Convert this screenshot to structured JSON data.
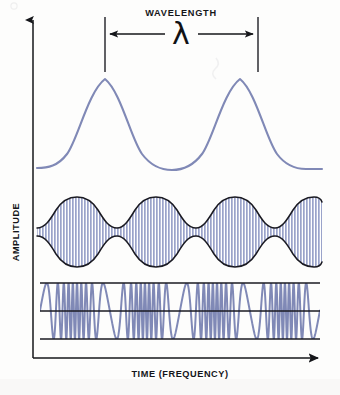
{
  "figure": {
    "background_color": "#fdfdfc",
    "ink_color": "#15161a",
    "wave_color": "#8089b6",
    "envelope_color": "#1a1a22",
    "carrier_fill_color": "#9aa3ca",
    "axes": {
      "y_label": "AMPLITUDE",
      "x_label": "TIME (FREQUENCY)"
    },
    "annotation": {
      "title": "WAVELENGTH",
      "symbol": "λ",
      "arrow_style": "double-headed",
      "marker_left_x": 105,
      "marker_right_x": 258
    }
  },
  "chart_data": {
    "type": "line",
    "title": "",
    "xlabel": "TIME (FREQUENCY)",
    "ylabel": "AMPLITUDE",
    "grid": false,
    "legend": null,
    "annotations": [
      {
        "text": "WAVELENGTH",
        "symbol": "λ",
        "type": "span-measure",
        "from_x": 105,
        "to_x": 258,
        "describes": "one full period of the top carrier sine wave"
      }
    ],
    "panels": [
      {
        "name": "carrier-sine-wave",
        "type": "line",
        "description": "Smooth unmodulated sine carrier showing two full cycles",
        "cycles": 2,
        "amplitude": 1.0,
        "baseline_y": 128,
        "peak_y": 78,
        "trough_y": 170,
        "x_start": 37,
        "x_end": 322,
        "color": "#8089b6"
      },
      {
        "name": "amplitude-modulated-wave",
        "type": "area",
        "description": "AM signal: dense carrier oscillations bounded by a slow sinusoidal envelope with four lobes",
        "envelope_cycles": 4,
        "carrier_cycles": 60,
        "envelope_min_amplitude": 0.12,
        "envelope_max_amplitude": 1.0,
        "center_y": 232,
        "max_half_height": 35,
        "x_start": 37,
        "x_end": 322,
        "outline_color": "#1a1a22",
        "fill_color": "#9aa3ca"
      },
      {
        "name": "frequency-modulated-wave",
        "type": "line",
        "description": "FM signal: constant amplitude square-bounded oscillation whose frequency varies along the time axis",
        "amplitude": 1.0,
        "center_y": 311,
        "top_y": 283,
        "bottom_y": 339,
        "x_start": 40,
        "x_end": 320,
        "frequency_cycles_visible": 38,
        "color": "#8089b6",
        "bound_line_color": "#1a1a22"
      }
    ]
  }
}
